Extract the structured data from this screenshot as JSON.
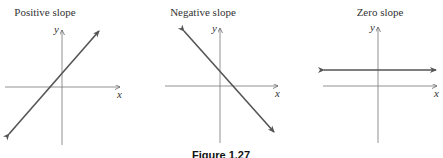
{
  "figure": {
    "caption": "Figure 1.27",
    "panels": [
      {
        "title": "Positive slope",
        "x_label": "x",
        "y_label": "y",
        "slope": "positive"
      },
      {
        "title": "Negative slope",
        "x_label": "x",
        "y_label": "y",
        "slope": "negative"
      },
      {
        "title": "Zero slope",
        "x_label": "x",
        "y_label": "y",
        "slope": "zero"
      }
    ]
  },
  "colors": {
    "axis": "#555555",
    "line": "#555555"
  }
}
